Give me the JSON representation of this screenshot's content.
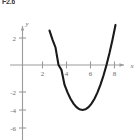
{
  "figure": {
    "label": "F2.6"
  },
  "chart_data": {
    "type": "line",
    "title": "",
    "subtitle": "",
    "xlabel": "x",
    "ylabel": "y",
    "xlim": [
      -1.1,
      9.2
    ],
    "ylim": [
      -6.9,
      3.2
    ],
    "grid": false,
    "legend": null,
    "x_ticks": [
      2,
      4,
      6,
      8
    ],
    "x_tick_labels": [
      "2",
      "4",
      "6",
      "8"
    ],
    "y_ticks": [
      2,
      -2,
      -4,
      -6
    ],
    "y_tick_labels": [
      "2",
      "-2",
      "-4",
      "-6"
    ],
    "annotations": [],
    "series": [
      {
        "name": "parabola",
        "equation": "y = (x - 3)(x - 7)",
        "color": "#1a1a1a",
        "vertex": [
          5,
          -4
        ],
        "roots": [
          3,
          7
        ],
        "x": [
          2.25,
          2.5,
          2.75,
          3,
          3.25,
          3.5,
          3.75,
          4,
          4.25,
          4.5,
          4.75,
          5,
          5.25,
          5.5,
          5.75,
          6,
          6.25,
          6.5,
          6.75,
          7,
          7.25,
          7.5,
          7.75
        ],
        "values": [
          3.0625,
          2.25,
          1.5625,
          0,
          -0.4375,
          -1.75,
          -2.4375,
          -3,
          -3.4375,
          -3.75,
          -3.9375,
          -4,
          -3.9375,
          -3.75,
          -3.4375,
          -3,
          -2.4375,
          -1.75,
          -0.9375,
          0,
          1.0625,
          2.25,
          3.5625
        ]
      }
    ]
  },
  "axes": {
    "x_axis_name": "x",
    "y_axis_name": "y"
  }
}
